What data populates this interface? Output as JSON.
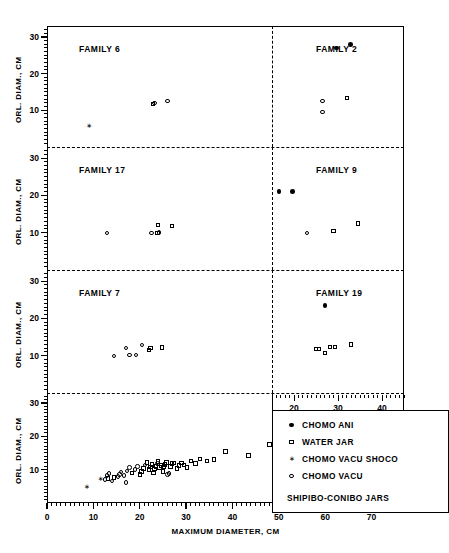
{
  "figure": {
    "caption": "SHIPIBO-CONIBO JARS",
    "x_axis_main": "MAXIMUM DIAMETER, CM",
    "x_axis_right": "MAX. DIAM., CM",
    "y_axis": "ORL. DIAM., CM"
  },
  "legend": {
    "footer": "SHIPIBO-CONIBO JARS",
    "entries": [
      {
        "label": "CHOMO ANI",
        "symbol": "filled-circle"
      },
      {
        "label": "WATER JAR",
        "symbol": "open-square"
      },
      {
        "label": "CHOMO VACU SHOCO",
        "symbol": "star"
      },
      {
        "label": "CHOMO VACU",
        "symbol": "open-circle"
      }
    ]
  },
  "panels": [
    {
      "name": "FAMILY 6",
      "row": 0,
      "col": 0
    },
    {
      "name": "FAMILY 2",
      "row": 0,
      "col": 1
    },
    {
      "name": "FAMILY 17",
      "row": 1,
      "col": 0
    },
    {
      "name": "FAMILY 9",
      "row": 1,
      "col": 1
    },
    {
      "name": "FAMILY 7",
      "row": 2,
      "col": 0
    },
    {
      "name": "FAMILY 19",
      "row": 2,
      "col": 1
    },
    {
      "name": "",
      "row": 3,
      "col": 0
    }
  ],
  "chart_data": {
    "type": "scatter",
    "title": "SHIPIBO-CONIBO JARS",
    "xlabel": "MAXIMUM DIAMETER, CM",
    "ylabel": "ORL. DIAM., CM",
    "xlabel_right": "MAX. DIAM., CM",
    "xlim": [
      0,
      77
    ],
    "ylim": [
      0,
      33
    ],
    "xlim_right": [
      15,
      45
    ],
    "xticks": [
      0,
      10,
      20,
      30,
      40,
      50,
      60,
      70
    ],
    "xticks_right": [
      20,
      30,
      40
    ],
    "yticks": [
      10,
      20,
      30
    ],
    "grid": false,
    "legend_position": "bottom-right",
    "series_symbols": {
      "CHOMO ANI": "filled-circle",
      "WATER JAR": "open-square",
      "CHOMO VACU SHOCO": "star",
      "CHOMO VACU": "open-circle"
    },
    "subplots": [
      {
        "panel": "FAMILY 6",
        "row": 0,
        "col": 0,
        "points": [
          {
            "x": 9.0,
            "y": 5.5,
            "series": "CHOMO VACU SHOCO"
          },
          {
            "x": 22.8,
            "y": 11.8,
            "series": "WATER JAR"
          },
          {
            "x": 23.2,
            "y": 12.0,
            "series": "CHOMO VACU"
          },
          {
            "x": 26.0,
            "y": 12.5,
            "series": "CHOMO VACU"
          },
          {
            "x": 62.5,
            "y": 27.0,
            "series": "CHOMO ANI"
          },
          {
            "x": 65.5,
            "y": 28.0,
            "series": "CHOMO ANI"
          }
        ]
      },
      {
        "panel": "FAMILY 2",
        "row": 0,
        "col": 1,
        "points": [
          {
            "x": 26.5,
            "y": 12.5,
            "series": "CHOMO VACU"
          },
          {
            "x": 26.5,
            "y": 9.5,
            "series": "CHOMO VACU"
          },
          {
            "x": 32.0,
            "y": 13.3,
            "series": "WATER JAR"
          }
        ]
      },
      {
        "panel": "FAMILY 17",
        "row": 1,
        "col": 0,
        "points": [
          {
            "x": 13.0,
            "y": 10.0,
            "series": "CHOMO VACU"
          },
          {
            "x": 22.5,
            "y": 10.0,
            "series": "CHOMO VACU"
          },
          {
            "x": 23.8,
            "y": 10.0,
            "series": "WATER JAR"
          },
          {
            "x": 24.2,
            "y": 10.1,
            "series": "CHOMO VACU"
          },
          {
            "x": 24.0,
            "y": 12.0,
            "series": "WATER JAR"
          },
          {
            "x": 27.0,
            "y": 11.8,
            "series": "WATER JAR"
          },
          {
            "x": 50.0,
            "y": 21.0,
            "series": "CHOMO ANI"
          },
          {
            "x": 53.0,
            "y": 21.0,
            "series": "CHOMO ANI"
          }
        ]
      },
      {
        "panel": "FAMILY 9",
        "row": 1,
        "col": 1,
        "points": [
          {
            "x": 23.0,
            "y": 10.0,
            "series": "CHOMO VACU"
          },
          {
            "x": 29.0,
            "y": 10.5,
            "series": "WATER JAR"
          },
          {
            "x": 34.5,
            "y": 12.5,
            "series": "WATER JAR"
          }
        ]
      },
      {
        "panel": "FAMILY 7",
        "row": 2,
        "col": 0,
        "points": [
          {
            "x": 14.5,
            "y": 10.0,
            "series": "CHOMO VACU"
          },
          {
            "x": 17.0,
            "y": 12.0,
            "series": "CHOMO VACU"
          },
          {
            "x": 17.8,
            "y": 10.2,
            "series": "CHOMO VACU"
          },
          {
            "x": 19.2,
            "y": 10.2,
            "series": "CHOMO VACU"
          },
          {
            "x": 20.5,
            "y": 12.8,
            "series": "CHOMO VACU"
          },
          {
            "x": 22.0,
            "y": 11.5,
            "series": "WATER JAR"
          },
          {
            "x": 22.3,
            "y": 12.1,
            "series": "WATER JAR"
          },
          {
            "x": 24.8,
            "y": 12.2,
            "series": "WATER JAR"
          },
          {
            "x": 60.0,
            "y": 23.5,
            "series": "CHOMO ANI"
          }
        ]
      },
      {
        "panel": "FAMILY 19",
        "row": 2,
        "col": 1,
        "points": [
          {
            "x": 25.0,
            "y": 11.8,
            "series": "WATER JAR"
          },
          {
            "x": 25.7,
            "y": 11.8,
            "series": "WATER JAR"
          },
          {
            "x": 27.0,
            "y": 10.8,
            "series": "WATER JAR"
          },
          {
            "x": 28.2,
            "y": 12.4,
            "series": "WATER JAR"
          },
          {
            "x": 29.3,
            "y": 12.4,
            "series": "WATER JAR"
          },
          {
            "x": 33.0,
            "y": 13.0,
            "series": "WATER JAR"
          }
        ]
      },
      {
        "panel": "ALL",
        "row": 3,
        "col": 0,
        "points": [
          {
            "x": 8.5,
            "y": 4.8,
            "series": "CHOMO VACU SHOCO"
          },
          {
            "x": 11.5,
            "y": 7.2,
            "series": "CHOMO VACU SHOCO"
          },
          {
            "x": 12.5,
            "y": 7.0,
            "series": "CHOMO VACU"
          },
          {
            "x": 13.2,
            "y": 7.4,
            "series": "WATER JAR"
          },
          {
            "x": 13.0,
            "y": 8.2,
            "series": "CHOMO VACU"
          },
          {
            "x": 13.4,
            "y": 8.8,
            "series": "CHOMO VACU"
          },
          {
            "x": 14.5,
            "y": 7.6,
            "series": "WATER JAR"
          },
          {
            "x": 15.3,
            "y": 8.0,
            "series": "CHOMO VACU"
          },
          {
            "x": 15.6,
            "y": 8.6,
            "series": "CHOMO VACU"
          },
          {
            "x": 16.0,
            "y": 9.3,
            "series": "CHOMO VACU"
          },
          {
            "x": 16.6,
            "y": 8.2,
            "series": "CHOMO VACU"
          },
          {
            "x": 17.2,
            "y": 9.6,
            "series": "CHOMO VACU"
          },
          {
            "x": 17.8,
            "y": 10.6,
            "series": "CHOMO VACU"
          },
          {
            "x": 18.4,
            "y": 9.0,
            "series": "WATER JAR"
          },
          {
            "x": 19.0,
            "y": 10.0,
            "series": "CHOMO VACU"
          },
          {
            "x": 19.5,
            "y": 11.0,
            "series": "CHOMO VACU"
          },
          {
            "x": 20.0,
            "y": 8.6,
            "series": "WATER JAR"
          },
          {
            "x": 20.4,
            "y": 9.4,
            "series": "WATER JAR"
          },
          {
            "x": 20.8,
            "y": 10.4,
            "series": "WATER JAR"
          },
          {
            "x": 21.2,
            "y": 11.4,
            "series": "CHOMO VACU"
          },
          {
            "x": 21.6,
            "y": 12.2,
            "series": "WATER JAR"
          },
          {
            "x": 22.0,
            "y": 10.0,
            "series": "WATER JAR"
          },
          {
            "x": 22.3,
            "y": 10.8,
            "series": "WATER JAR"
          },
          {
            "x": 22.6,
            "y": 11.6,
            "series": "WATER JAR"
          },
          {
            "x": 23.0,
            "y": 9.0,
            "series": "WATER JAR"
          },
          {
            "x": 23.2,
            "y": 10.2,
            "series": "WATER JAR"
          },
          {
            "x": 23.5,
            "y": 11.0,
            "series": "WATER JAR"
          },
          {
            "x": 23.8,
            "y": 11.8,
            "series": "CHOMO VACU"
          },
          {
            "x": 24.0,
            "y": 12.4,
            "series": "WATER JAR"
          },
          {
            "x": 24.3,
            "y": 10.6,
            "series": "WATER JAR"
          },
          {
            "x": 24.6,
            "y": 11.2,
            "series": "WATER JAR"
          },
          {
            "x": 25.0,
            "y": 9.4,
            "series": "WATER JAR"
          },
          {
            "x": 25.2,
            "y": 10.8,
            "series": "WATER JAR"
          },
          {
            "x": 25.5,
            "y": 11.6,
            "series": "WATER JAR"
          },
          {
            "x": 25.8,
            "y": 12.2,
            "series": "WATER JAR"
          },
          {
            "x": 26.0,
            "y": 8.6,
            "series": "CHOMO VACU"
          },
          {
            "x": 26.3,
            "y": 8.8,
            "series": "CHOMO VACU"
          },
          {
            "x": 26.6,
            "y": 11.0,
            "series": "WATER JAR"
          },
          {
            "x": 27.0,
            "y": 11.8,
            "series": "WATER JAR"
          },
          {
            "x": 27.4,
            "y": 12.0,
            "series": "WATER JAR"
          },
          {
            "x": 28.0,
            "y": 10.4,
            "series": "WATER JAR"
          },
          {
            "x": 28.5,
            "y": 11.2,
            "series": "WATER JAR"
          },
          {
            "x": 29.0,
            "y": 12.0,
            "series": "WATER JAR"
          },
          {
            "x": 29.6,
            "y": 11.4,
            "series": "WATER JAR"
          },
          {
            "x": 30.2,
            "y": 10.6,
            "series": "WATER JAR"
          },
          {
            "x": 31.0,
            "y": 12.6,
            "series": "WATER JAR"
          },
          {
            "x": 32.0,
            "y": 11.8,
            "series": "WATER JAR"
          },
          {
            "x": 33.0,
            "y": 13.2,
            "series": "WATER JAR"
          },
          {
            "x": 34.5,
            "y": 12.6,
            "series": "WATER JAR"
          },
          {
            "x": 36.0,
            "y": 13.0,
            "series": "WATER JAR"
          },
          {
            "x": 38.5,
            "y": 15.4,
            "series": "WATER JAR"
          },
          {
            "x": 43.5,
            "y": 14.2,
            "series": "WATER JAR"
          },
          {
            "x": 48.0,
            "y": 17.6,
            "series": "WATER JAR"
          },
          {
            "x": 49.5,
            "y": 19.0,
            "series": "WATER JAR"
          },
          {
            "x": 50.5,
            "y": 19.4,
            "series": "CHOMO ANI"
          },
          {
            "x": 52.0,
            "y": 19.6,
            "series": "CHOMO ANI"
          },
          {
            "x": 53.0,
            "y": 22.6,
            "series": "CHOMO ANI"
          },
          {
            "x": 53.2,
            "y": 19.4,
            "series": "CHOMO ANI"
          },
          {
            "x": 53.5,
            "y": 16.8,
            "series": "CHOMO ANI"
          },
          {
            "x": 58.0,
            "y": 24.4,
            "series": "CHOMO ANI"
          },
          {
            "x": 58.2,
            "y": 19.6,
            "series": "CHOMO ANI"
          },
          {
            "x": 58.5,
            "y": 16.6,
            "series": "CHOMO ANI"
          },
          {
            "x": 62.5,
            "y": 19.6,
            "series": "CHOMO ANI"
          },
          {
            "x": 63.5,
            "y": 19.6,
            "series": "CHOMO ANI"
          },
          {
            "x": 63.8,
            "y": 25.0,
            "series": "CHOMO ANI"
          },
          {
            "x": 64.0,
            "y": 16.6,
            "series": "CHOMO ANI"
          },
          {
            "x": 69.0,
            "y": 24.4,
            "series": "CHOMO ANI"
          },
          {
            "x": 72.0,
            "y": 25.0,
            "series": "CHOMO ANI"
          },
          {
            "x": 17.0,
            "y": 6.2,
            "series": "CHOMO VACU"
          },
          {
            "x": 14.0,
            "y": 6.6,
            "series": "CHOMO VACU"
          }
        ]
      }
    ]
  }
}
